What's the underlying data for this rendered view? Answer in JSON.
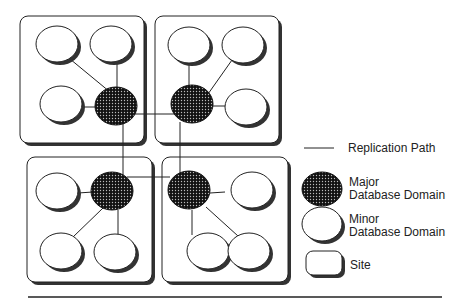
{
  "diagram": {
    "sites": [
      {
        "id": "site-top-left",
        "x": 20,
        "y": 16,
        "w": 124,
        "h": 127
      },
      {
        "id": "site-top-right",
        "x": 155,
        "y": 16,
        "w": 124,
        "h": 127
      },
      {
        "id": "site-bottom-left",
        "x": 27,
        "y": 157,
        "w": 125,
        "h": 125
      },
      {
        "id": "site-bottom-right",
        "x": 162,
        "y": 157,
        "w": 126,
        "h": 125
      }
    ],
    "major_domains": [
      {
        "id": "major-tl",
        "cx": 115,
        "cy": 105
      },
      {
        "id": "major-tr",
        "cx": 192,
        "cy": 103
      },
      {
        "id": "major-bl",
        "cx": 112,
        "cy": 191
      },
      {
        "id": "major-br",
        "cx": 190,
        "cy": 190
      }
    ],
    "minor_domains": [
      {
        "cx": 57,
        "cy": 43
      },
      {
        "cx": 111,
        "cy": 43
      },
      {
        "cx": 61,
        "cy": 103
      },
      {
        "cx": 189,
        "cy": 45
      },
      {
        "cx": 243,
        "cy": 45
      },
      {
        "cx": 246,
        "cy": 107
      },
      {
        "cx": 57,
        "cy": 191
      },
      {
        "cx": 61,
        "cy": 250
      },
      {
        "cx": 115,
        "cy": 252
      },
      {
        "cx": 252,
        "cy": 190
      },
      {
        "cx": 208,
        "cy": 250
      },
      {
        "cx": 249,
        "cy": 250
      }
    ]
  },
  "legend": {
    "replication_path": "Replication Path",
    "major_line1": "Major",
    "major_line2": "Database Domain",
    "minor_line1": "Minor",
    "minor_line2": "Database Domain",
    "site": "Site"
  }
}
